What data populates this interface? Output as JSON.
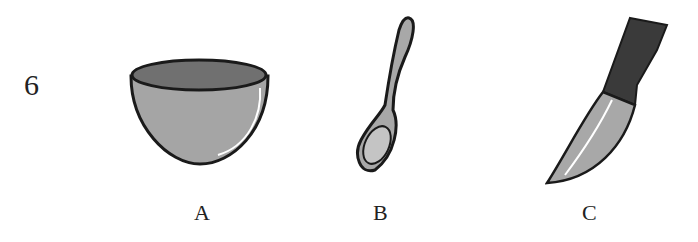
{
  "question": {
    "number": "6"
  },
  "options": [
    {
      "label": "A",
      "item": "bowl"
    },
    {
      "label": "B",
      "item": "spoon"
    },
    {
      "label": "C",
      "item": "knife"
    }
  ],
  "colors": {
    "fill": "#a8a8a8",
    "dark": "#6e6e6e",
    "handle": "#3a3a3a",
    "outline": "#1a1a1a"
  }
}
